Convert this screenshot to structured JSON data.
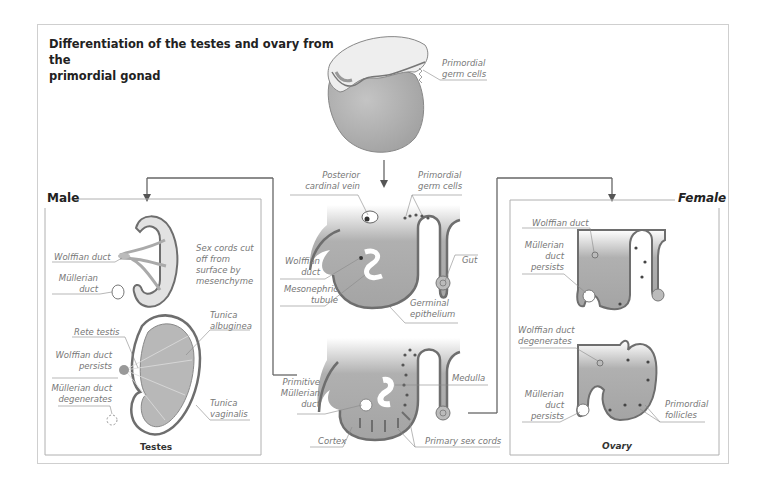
{
  "title": {
    "line1": "Differentiation of the testes and ovary from the",
    "line2": "primordial gonad"
  },
  "top": {
    "labels": [
      "Primordial",
      "germ cells"
    ]
  },
  "center_upper": {
    "posterior_cardinal_vein": [
      "Posterior",
      "cardinal vein"
    ],
    "primordial_germ_cells": [
      "Primordial",
      "germ cells"
    ],
    "wolffian_duct": [
      "Wolffian",
      "duct"
    ],
    "mesonephric_tubule": [
      "Mesonephric",
      "tubule"
    ],
    "gut": "Gut",
    "germinal_epithelium": [
      "Germinal",
      "epithelium"
    ]
  },
  "center_lower": {
    "medulla": "Medulla",
    "primitive_mullerian_duct": [
      "Primitive",
      "Müllerian",
      "duct"
    ],
    "cortex": "Cortex",
    "primary_sex_cords": "Primary sex cords"
  },
  "male": {
    "heading": "Male",
    "upper": {
      "wolffian_duct": "Wolffian duct",
      "mullerian_duct": [
        "Müllerian",
        "duct"
      ],
      "sex_cords": [
        "Sex cords cut",
        "off from",
        "surface by",
        "mesenchyme"
      ]
    },
    "lower": {
      "rete_testis": "Rete testis",
      "tunica_albuginea": [
        "Tunica",
        "albuginea"
      ],
      "wolffian_persists": [
        "Wolffian duct",
        "persists"
      ],
      "mullerian_degenerates": [
        "Müllerian duct",
        "degenerates"
      ],
      "tunica_vaginalis": [
        "Tunica",
        "vaginalis"
      ]
    },
    "caption": "Testes"
  },
  "female": {
    "heading": "Female",
    "upper": {
      "wolffian_duct": "Wolffian duct",
      "mullerian_persists": [
        "Müllerian",
        "duct",
        "persists"
      ]
    },
    "lower": {
      "wolffian_degenerates": [
        "Wolffian duct",
        "degenerates"
      ],
      "mullerian_persists": [
        "Müllerian",
        "duct",
        "persists"
      ],
      "primordial_follicles": [
        "Primordial",
        "follicles"
      ]
    },
    "caption": "Ovary"
  },
  "colors": {
    "tissue_fill": "#a8a8a8",
    "tissue_outline": "#6e6e6e",
    "connector": "#666666",
    "label_text": "#777777",
    "heading_text": "#222222"
  }
}
